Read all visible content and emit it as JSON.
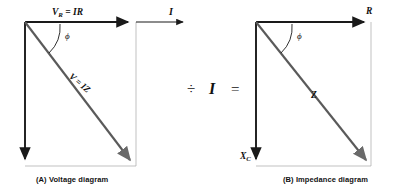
{
  "figure": {
    "type": "phasor-and-impedance-diagram",
    "relationship": "Voltage diagram divided by I equals Impedance diagram",
    "stroke_color": "#1a1a1a",
    "thin_color": "#8c8c8c",
    "diagonal_color": "#5a5a5a",
    "background": "#ffffff"
  },
  "operators": {
    "divide": "÷",
    "current": "I",
    "equals": "="
  },
  "panel_a": {
    "caption": "(A)  Voltage diagram",
    "caption_tag": "(A)",
    "caption_text": "Voltage diagram",
    "labels": {
      "horizontal_main": "V",
      "horizontal_main_sub": "R",
      "horizontal_main_rest": " = IR",
      "horizontal_full": "V_R = IR",
      "current_arrow": "I",
      "vertical": "V",
      "vertical_sub": "C",
      "vertical_rest": " = IX",
      "vertical_rest_sub": "C",
      "vertical_full": "V_C = IX_C",
      "diagonal": "V = IZ",
      "angle": "ϕ"
    }
  },
  "panel_b": {
    "caption": "(B)  Impedance diagram",
    "caption_tag": "(B)",
    "caption_text": "Impedance diagram",
    "labels": {
      "horizontal": "R",
      "vertical": "X",
      "vertical_sub": "C",
      "vertical_full": "X_C",
      "diagonal": "Z",
      "angle": "ϕ"
    }
  }
}
